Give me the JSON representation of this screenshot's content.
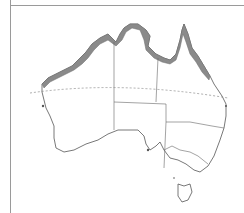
{
  "map": {
    "region": "Australia",
    "type": "species distribution map",
    "layers": {
      "distribution": {
        "description": "northern coastal range from Pilbara through Kimberley, Top End, Gulf of Carpentaria and Cape York down the Queensland east coast",
        "color": "#8a8a8a"
      },
      "coastline": {
        "color": "#555555"
      },
      "state_borders": {
        "color": "#666666"
      },
      "tropic_of_capricorn": {
        "style": "dashed",
        "color": "#888888"
      }
    },
    "frame_color": "#9a9a9a"
  }
}
